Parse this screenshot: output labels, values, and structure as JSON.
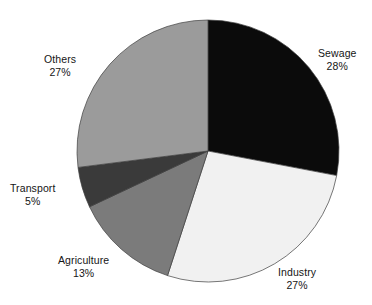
{
  "chart_data": {
    "type": "pie",
    "title": "",
    "xlabel": "",
    "ylabel": "",
    "categories": [
      "Sewage",
      "Industry",
      "Agriculture",
      "Transport",
      "Others"
    ],
    "values": [
      28,
      27,
      13,
      5,
      27
    ],
    "unit": "%",
    "legend": "none",
    "grid": false,
    "start_angle_deg": 0,
    "direction": "clockwise",
    "labels_position": "outside",
    "slices": [
      {
        "name": "Sewage",
        "value": 28,
        "value_label": "28%",
        "color": "#0b0b0b",
        "start_deg": 0,
        "end_deg": 100.8
      },
      {
        "name": "Industry",
        "value": 27,
        "value_label": "27%",
        "color": "#f1f1f1",
        "start_deg": 100.8,
        "end_deg": 198.0
      },
      {
        "name": "Agriculture",
        "value": 13,
        "value_label": "13%",
        "color": "#7b7b7b",
        "start_deg": 198.0,
        "end_deg": 244.8
      },
      {
        "name": "Transport",
        "value": 5,
        "value_label": "5%",
        "color": "#3a3a3a",
        "start_deg": 244.8,
        "end_deg": 262.8
      },
      {
        "name": "Others",
        "value": 27,
        "value_label": "27%",
        "color": "#9b9b9b",
        "start_deg": 262.8,
        "end_deg": 360.0
      }
    ],
    "geometry": {
      "center_x": 208,
      "center_y": 151,
      "radius": 131
    },
    "outline_color": "#3d3d3d",
    "background": "#ffffff"
  }
}
